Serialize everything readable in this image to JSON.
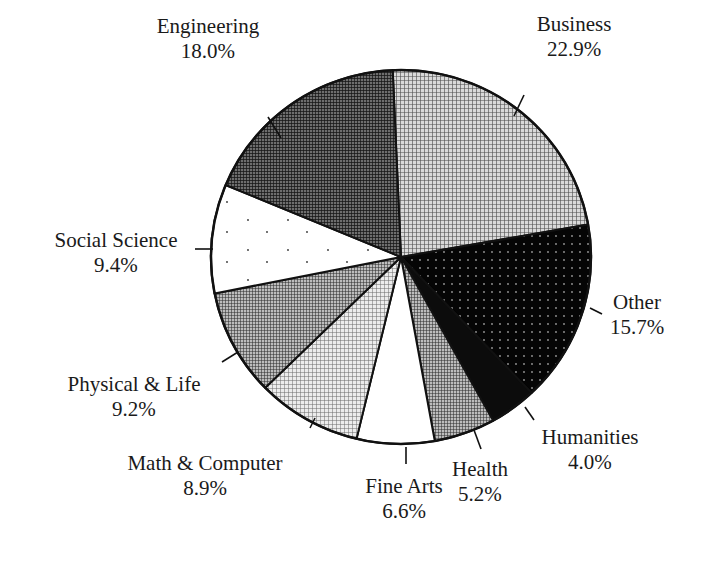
{
  "chart_data": {
    "type": "pie",
    "title": "",
    "start_angle_deg": -2.5,
    "direction": "clockwise",
    "slices": [
      {
        "label": "Business",
        "value": 22.9,
        "value_text": "22.9%",
        "fill": "#8c8c8c",
        "pattern": "grid-light"
      },
      {
        "label": "Other",
        "value": 15.7,
        "value_text": "15.7%",
        "fill": "#0a0a0a",
        "pattern": "dots-dark"
      },
      {
        "label": "Humanities",
        "value": 4.0,
        "value_text": "4.0%",
        "fill": "#111111",
        "pattern": "solid-dark"
      },
      {
        "label": "Health",
        "value": 5.2,
        "value_text": "5.2%",
        "fill": "#7a7a7a",
        "pattern": "grid-mid"
      },
      {
        "label": "Fine Arts",
        "value": 6.6,
        "value_text": "6.6%",
        "fill": "#ffffff",
        "pattern": "none"
      },
      {
        "label": "Math & Computer",
        "value": 8.9,
        "value_text": "8.9%",
        "fill": "#b5b5b5",
        "pattern": "grid-fine"
      },
      {
        "label": "Physical & Life",
        "value": 9.2,
        "value_text": "9.2%",
        "fill": "#5e5e5e",
        "pattern": "grid-mid"
      },
      {
        "label": "Social Science",
        "value": 9.4,
        "value_text": "9.4%",
        "fill": "#ffffff",
        "pattern": "sparse-dots"
      },
      {
        "label": "Engineering",
        "value": 18.0,
        "value_text": "18.0%",
        "fill": "#3a3a3a",
        "pattern": "grid-dark"
      }
    ],
    "legend": "none (callout labels)",
    "units": "%"
  },
  "labels": [
    {
      "name": "Engineering",
      "pct": "18.0%",
      "x": 208,
      "y": 14,
      "tick": [
        [
          268,
          117
        ],
        [
          281,
          138
        ]
      ]
    },
    {
      "name": "Business",
      "pct": "22.9%",
      "x": 574,
      "y": 12,
      "tick": [
        [
          524,
          95
        ],
        [
          514,
          116
        ]
      ]
    },
    {
      "name": "Social Science",
      "pct": "9.4%",
      "x": 116,
      "y": 228,
      "tick": [
        [
          195,
          249
        ],
        [
          213,
          249
        ]
      ]
    },
    {
      "name": "Other",
      "pct": "15.7%",
      "x": 637,
      "y": 290,
      "tick": [
        [
          590,
          308
        ],
        [
          602,
          314
        ]
      ]
    },
    {
      "name": "Physical & Life",
      "pct": "9.2%",
      "x": 134,
      "y": 372,
      "tick": [
        [
          222,
          362
        ],
        [
          238,
          352
        ]
      ]
    },
    {
      "name": "Humanities",
      "pct": "4.0%",
      "x": 590,
      "y": 425,
      "tick": [
        [
          525,
          407
        ],
        [
          534,
          420
        ]
      ]
    },
    {
      "name": "Math & Computer",
      "pct": "8.9%",
      "x": 205,
      "y": 451,
      "tick": [
        [
          310,
          428
        ],
        [
          315,
          418
        ]
      ]
    },
    {
      "name": "Health",
      "pct": "5.2%",
      "x": 480,
      "y": 457,
      "tick": [
        [
          474,
          430
        ],
        [
          481,
          449
        ]
      ]
    },
    {
      "name": "Fine Arts",
      "pct": "6.6%",
      "x": 404,
      "y": 474,
      "tick": [
        [
          406,
          447
        ],
        [
          406,
          464
        ]
      ]
    }
  ],
  "geometry": {
    "cx": 401,
    "cy": 257,
    "rx": 190,
    "ry": 187
  }
}
